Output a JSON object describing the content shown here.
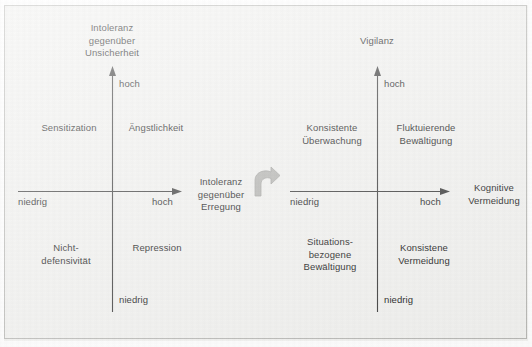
{
  "figure": {
    "background_color": "#f2f2f0",
    "border_color": "#b9b9b6",
    "text_color": "#171717",
    "connector_color": "#b0b0ad",
    "connector_icon": "curved-block-arrow-icon"
  },
  "diagrams": [
    {
      "id": "left",
      "y_axis": {
        "title": "Intoleranz\ngegenüber\nUnsicherheit",
        "high_tick": "hoch",
        "low_tick": "niedrig"
      },
      "x_axis": {
        "title": "Intoleranz\ngegenüber\nErregung",
        "low_tick": "niedrig",
        "high_tick": "hoch"
      },
      "quadrants": {
        "top_left": "Sensitization",
        "top_right": "Ängstlichkeit",
        "bottom_left": "Nicht-\ndefensivität",
        "bottom_right": "Repression"
      }
    },
    {
      "id": "right",
      "y_axis": {
        "title": "Vigilanz",
        "high_tick": "hoch",
        "low_tick": "niedrig"
      },
      "x_axis": {
        "title": "Kognitive\nVermeidung",
        "low_tick": "niedrig",
        "high_tick": "hoch"
      },
      "quadrants": {
        "top_left": "Konsistente\nÜberwachung",
        "top_right": "Fluktuierende\nBewältigung",
        "bottom_left": "Situations-\nbezogene\nBewältigung",
        "bottom_right": "Konsistene\nVermeidung"
      }
    }
  ]
}
